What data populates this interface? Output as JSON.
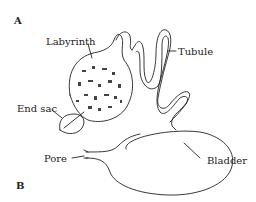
{
  "diagram": {
    "panel_labels": {
      "a": "A",
      "b": "B"
    },
    "labels": {
      "labyrinth": "Labyrinth",
      "tubule": "Tubule",
      "end_sac": "End sac",
      "pore": "Pore",
      "bladder": "Bladder"
    },
    "colors": {
      "ink": "#222222",
      "background": "#ffffff"
    }
  }
}
